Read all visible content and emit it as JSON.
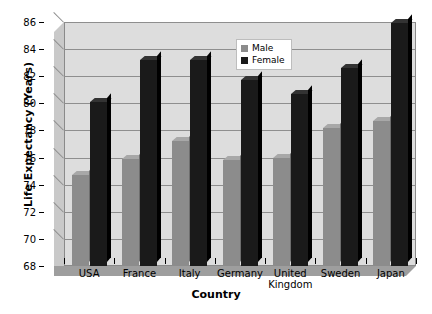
{
  "chart_data": {
    "type": "bar",
    "title": "",
    "xlabel": "Country",
    "ylabel": "Life Expectancy (Years)",
    "categories": [
      "USA",
      "France",
      "Italy",
      "Germany",
      "United Kingdom",
      "Sweden",
      "Japan"
    ],
    "category_lines": [
      [
        "USA"
      ],
      [
        "France"
      ],
      [
        "Italy"
      ],
      [
        "Germany"
      ],
      [
        "United",
        "Kingdom"
      ],
      [
        "Sweden"
      ],
      [
        "Japan"
      ]
    ],
    "series": [
      {
        "name": "Male",
        "color": "#8c8c8c",
        "values": [
          74.7,
          75.9,
          77.2,
          75.8,
          76.0,
          78.2,
          78.7
        ]
      },
      {
        "name": "Female",
        "color": "#1a1a1a",
        "values": [
          80.1,
          83.2,
          83.2,
          81.7,
          80.7,
          82.6,
          85.9
        ]
      }
    ],
    "ylim": [
      68,
      86
    ],
    "yticks": [
      68,
      70,
      72,
      74,
      76,
      78,
      80,
      82,
      84,
      86
    ],
    "ytick_labels": [
      "68",
      "70",
      "72",
      "74",
      "76",
      "78",
      "80",
      "82",
      "84",
      "86"
    ],
    "grid": true,
    "legend_position": "upper-right-inside",
    "style": "3d-column",
    "plot_background": "#dddddd",
    "page_background": "#ffffff"
  },
  "legend": {
    "items": [
      {
        "label": "Male"
      },
      {
        "label": "Female"
      }
    ]
  }
}
